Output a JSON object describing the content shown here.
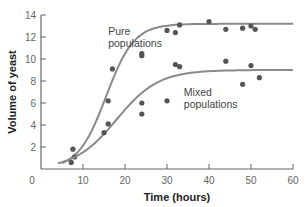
{
  "chart_data": {
    "type": "scatter",
    "title": "",
    "xlabel": "Time (hours)",
    "ylabel": "Volume of yeast",
    "xlim": [
      0,
      60
    ],
    "ylim": [
      0,
      14
    ],
    "xticks": [
      0,
      10,
      20,
      30,
      40,
      50,
      60
    ],
    "yticks": [
      2,
      4,
      6,
      8,
      10,
      12,
      14
    ],
    "grid": false,
    "legend": "none (inline annotations)",
    "series": [
      {
        "name": "Pure populations",
        "points": [
          [
            7.6,
            1.8
          ],
          [
            8,
            1.1
          ],
          [
            16,
            6.2
          ],
          [
            17,
            9.1
          ],
          [
            24,
            10.3
          ],
          [
            24,
            10.5
          ],
          [
            30,
            12.6
          ],
          [
            32,
            12.4
          ],
          [
            33,
            13.1
          ],
          [
            40,
            13.4
          ],
          [
            44,
            12.7
          ],
          [
            48,
            12.8
          ],
          [
            50,
            13.0
          ],
          [
            51,
            12.7
          ]
        ],
        "curve": {
          "type": "logistic",
          "K": 13.2,
          "midpoint": 15.5,
          "rate": 0.3,
          "start": 5
        }
      },
      {
        "name": "Mixed populations",
        "points": [
          [
            7.2,
            0.6
          ],
          [
            15,
            3.3
          ],
          [
            16,
            4.1
          ],
          [
            24,
            5.0
          ],
          [
            24,
            6.0
          ],
          [
            30,
            6.2
          ],
          [
            32,
            9.5
          ],
          [
            33,
            9.3
          ],
          [
            44,
            9.8
          ],
          [
            48,
            7.7
          ],
          [
            50,
            9.4
          ],
          [
            52,
            8.3
          ]
        ],
        "curve": {
          "type": "logistic",
          "K": 9.0,
          "midpoint": 18,
          "rate": 0.2,
          "start": 4
        }
      }
    ],
    "annotations": [
      {
        "text": [
          "Pure",
          "populations"
        ],
        "x": 16,
        "y": 12.2
      },
      {
        "text": [
          "Mixed",
          "populations"
        ],
        "x": 34,
        "y": 6.6
      }
    ],
    "colors": {
      "curve": "#8a8a8a",
      "point": "#555555",
      "axis": "#666666"
    }
  }
}
